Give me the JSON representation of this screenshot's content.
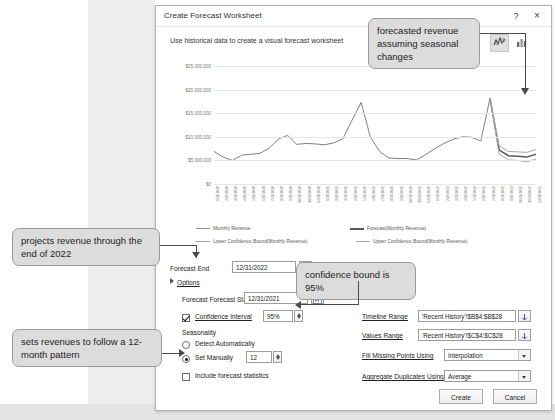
{
  "dialog": {
    "title": "Create Forecast Worksheet",
    "subtitle": "Use historical data to create a visual forecast worksheet",
    "help_label": "?",
    "close_label": "×",
    "chart_toggle_line": "line-chart-toggle",
    "chart_toggle_column": "column-chart-toggle"
  },
  "form": {
    "forecast_end_label": "Forecast End",
    "forecast_end_value": "12/31/2022",
    "options_label": "Options",
    "forecast_start_label": "Forecast Start",
    "forecast_start_value": "12/31/2021",
    "confidence_interval_label": "Confidence Interval",
    "confidence_interval_value": "95%",
    "seasonality_label": "Seasonality",
    "detect_automatically_label": "Detect Automatically",
    "set_manually_label": "Set Manually",
    "set_manually_value": "12",
    "include_statistics_label": "Include forecast statistics",
    "timeline_range_label": "Timeline Range",
    "timeline_range_value": "'Recent History'!$B$4:$B$28",
    "values_range_label": "Values Range",
    "values_range_value": "'Recent History'!$C$4:$C$28",
    "fill_missing_label": "Fill Missing Points Using",
    "fill_missing_value": "Interpolation",
    "aggregate_duplicates_label": "Aggregate Duplicates Using",
    "aggregate_duplicates_value": "Average"
  },
  "buttons": {
    "create": "Create",
    "cancel": "Cancel"
  },
  "callouts": {
    "forecast": "forecasted revenue assuming seasonal changes",
    "projects": "projects revenue through the end of 2022",
    "confidence": "confidence bound is 95%",
    "seasonality": "sets revenues to follow a 12-month pattern"
  },
  "chart_data": {
    "type": "line",
    "title": "",
    "xlabel": "",
    "ylabel": "",
    "ylim": [
      0,
      25000000
    ],
    "grid": true,
    "legend_position": "bottom",
    "ytick_labels": [
      "$25,000,000",
      "$20,000,000",
      "$15,000,000",
      "$10,000,000",
      "$5,000,000",
      "$0"
    ],
    "ytick_values": [
      25000000,
      20000000,
      15000000,
      10000000,
      5000000,
      0
    ],
    "categories": [
      "1/31/2020",
      "2/29/2020",
      "3/31/2020",
      "4/30/2020",
      "5/31/2020",
      "6/30/2020",
      "7/31/2020",
      "8/31/2020",
      "9/30/2020",
      "10/31/2020",
      "11/30/2020",
      "12/31/2020",
      "1/31/2021",
      "2/28/2021",
      "3/31/2021",
      "4/30/2021",
      "5/31/2021",
      "6/30/2021",
      "7/31/2021",
      "8/31/2021",
      "9/30/2021",
      "10/31/2021",
      "11/30/2021",
      "12/31/2021",
      "1/31/2022",
      "2/28/2022",
      "3/31/2022",
      "4/30/2022",
      "5/31/2022",
      "6/30/2022",
      "7/31/2022",
      "8/31/2022",
      "9/30/2022",
      "10/31/2022",
      "11/30/2022",
      "12/31/2022"
    ],
    "series": [
      {
        "name": "Monthly Revenue",
        "color": "#808080",
        "values": [
          6900000,
          5700000,
          5000000,
          6100000,
          6300000,
          6500000,
          7600000,
          9500000,
          10300000,
          8400000,
          8600000,
          8500000,
          8300000,
          8700000,
          9600000,
          13500000,
          17300000,
          9900000,
          6900000,
          5500000,
          5400000,
          5400000,
          5100000,
          6200000,
          7500000,
          8600000,
          9500000,
          10000000,
          9900000,
          9100000,
          18200000,
          null,
          null,
          null,
          null,
          null
        ]
      },
      {
        "name": "Forecast(Monthly Revenue)",
        "color": "#595959",
        "values": [
          null,
          null,
          null,
          null,
          null,
          null,
          null,
          null,
          null,
          null,
          null,
          null,
          null,
          null,
          null,
          null,
          null,
          null,
          null,
          null,
          null,
          null,
          null,
          null,
          null,
          null,
          null,
          null,
          null,
          null,
          18200000,
          7200000,
          6000000,
          5900000,
          5700000,
          6300000
        ]
      },
      {
        "name": "Lower Confidence Bound(Monthly Revenue)",
        "color": "#a6a6a6",
        "values": [
          null,
          null,
          null,
          null,
          null,
          null,
          null,
          null,
          null,
          null,
          null,
          null,
          null,
          null,
          null,
          null,
          null,
          null,
          null,
          null,
          null,
          null,
          null,
          null,
          null,
          null,
          null,
          null,
          null,
          null,
          18200000,
          6300000,
          5100000,
          5000000,
          4700000,
          5300000
        ]
      },
      {
        "name": "Upper Confidence Bound(Monthly Revenue)",
        "color": "#a6a6a6",
        "values": [
          null,
          null,
          null,
          null,
          null,
          null,
          null,
          null,
          null,
          null,
          null,
          null,
          null,
          null,
          null,
          null,
          null,
          null,
          null,
          null,
          null,
          null,
          null,
          null,
          null,
          null,
          null,
          null,
          null,
          null,
          18200000,
          8100000,
          6900000,
          6800000,
          6700000,
          7300000
        ]
      }
    ],
    "legend": [
      "Monthly Revenue",
      "Forecast(Monthly Revenue)",
      "Lower Confidence Bound(Monthly Revenue)",
      "Upper Confidence Bound(Monthly Revenue)"
    ]
  }
}
